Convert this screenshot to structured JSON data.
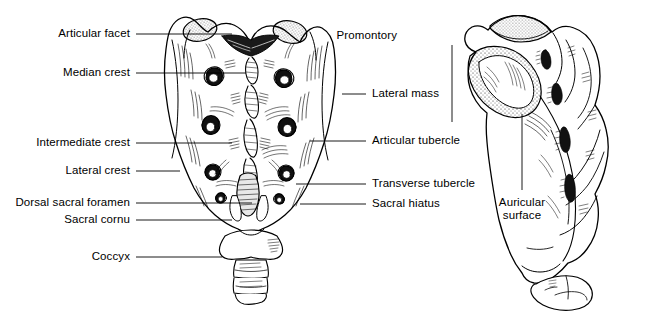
{
  "figure": {
    "background_color": "#ffffff",
    "ink_color": "#000000",
    "width": 650,
    "height": 320
  },
  "views": {
    "dorsal": {
      "name": "Dorsal (posterior) view of sacrum and coccyx",
      "labels_left": [
        {
          "id": "articular-facet",
          "text": "Articular facet",
          "text_x": 130,
          "text_y": 33,
          "leader_x1": 136,
          "leader_y1": 34,
          "leader_x2": 232,
          "leader_y2": 34
        },
        {
          "id": "median-crest",
          "text": "Median crest",
          "text_x": 130,
          "text_y": 72,
          "leader_x1": 136,
          "leader_y1": 73,
          "leader_x2": 246,
          "leader_y2": 73
        },
        {
          "id": "intermediate-crest",
          "text": "Intermediate crest",
          "text_x": 130,
          "text_y": 142,
          "leader_x1": 136,
          "leader_y1": 143,
          "leader_x2": 232,
          "leader_y2": 143
        },
        {
          "id": "lateral-crest",
          "text": "Lateral crest",
          "text_x": 130,
          "text_y": 170,
          "leader_x1": 136,
          "leader_y1": 171,
          "leader_x2": 180,
          "leader_y2": 171
        },
        {
          "id": "dorsal-sacral-foramen",
          "text": "Dorsal sacral foramen",
          "text_x": 130,
          "text_y": 202,
          "leader_x1": 136,
          "leader_y1": 203,
          "leader_x2": 252,
          "leader_y2": 203
        },
        {
          "id": "sacral-cornu",
          "text": "Sacral cornu",
          "text_x": 130,
          "text_y": 219,
          "leader_x1": 136,
          "leader_y1": 220,
          "leader_x2": 232,
          "leader_y2": 220
        },
        {
          "id": "coccyx",
          "text": "Coccyx",
          "text_x": 130,
          "text_y": 256,
          "leader_x1": 136,
          "leader_y1": 257,
          "leader_x2": 222,
          "leader_y2": 257
        }
      ],
      "labels_right": [
        {
          "id": "lateral-mass",
          "text": "Lateral mass",
          "text_x": 372,
          "text_y": 93,
          "leader_x1": 342,
          "leader_y1": 94,
          "leader_x2": 366,
          "leader_y2": 94
        },
        {
          "id": "articular-tubercle",
          "text": "Articular tubercle",
          "text_x": 372,
          "text_y": 140,
          "leader_x1": 310,
          "leader_y1": 141,
          "leader_x2": 366,
          "leader_y2": 141
        },
        {
          "id": "transverse-tubercle",
          "text": "Transverse tubercle",
          "text_x": 372,
          "text_y": 183,
          "leader_x1": 296,
          "leader_y1": 184,
          "leader_x2": 366,
          "leader_y2": 184
        },
        {
          "id": "sacral-hiatus",
          "text": "Sacral hiatus",
          "text_x": 372,
          "text_y": 203,
          "leader_x1": 300,
          "leader_y1": 204,
          "leader_x2": 366,
          "leader_y2": 204
        }
      ]
    },
    "lateral": {
      "name": "Lateral view of sacrum and coccyx",
      "labels": [
        {
          "id": "promontory",
          "text": "Promontory",
          "text_x": 397,
          "text_y": 35,
          "leader_x1": 452,
          "leader_y1": 45,
          "leader_x2": 452,
          "leader_y2": 122
        },
        {
          "id": "auricular-surface",
          "text_line1": "Auricular",
          "text_line2": "surface",
          "text_x": 522,
          "text_y": 196,
          "leader_x1": 522,
          "leader_y1": 114,
          "leader_x2": 522,
          "leader_y2": 190
        }
      ]
    }
  }
}
